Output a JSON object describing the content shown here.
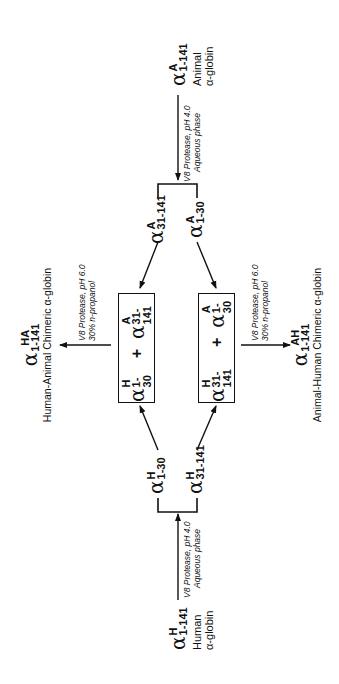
{
  "diagram": {
    "orientation": "rotated-90-ccw",
    "human_source": {
      "symbol": "α",
      "sup": "H",
      "sub": "1-141",
      "label_line1": "Human",
      "label_line2": "α-globin"
    },
    "animal_source": {
      "symbol": "α",
      "sup": "A",
      "sub": "1-141",
      "label_line1": "Animal",
      "label_line2": "α-globin"
    },
    "human_cleavage": {
      "line1": "V8 Protease, pH 4.0",
      "line2": "Aqueous phase"
    },
    "animal_cleavage": {
      "line1": "V8 Protease, pH 4.0",
      "line2": "Aqueous phase"
    },
    "human_fragments": [
      {
        "symbol": "α",
        "sup": "H",
        "sub": "1-30"
      },
      {
        "symbol": "α",
        "sup": "H",
        "sub": "31-141"
      }
    ],
    "animal_fragments": [
      {
        "symbol": "α",
        "sup": "A",
        "sub": "31-141"
      },
      {
        "symbol": "α",
        "sup": "A",
        "sub": "1-30"
      }
    ],
    "box_top": {
      "left": {
        "symbol": "α",
        "sup": "H",
        "sub": "1-30"
      },
      "op": "+",
      "right": {
        "symbol": "α",
        "sup": "A",
        "sub": "31-141"
      }
    },
    "box_bottom": {
      "left": {
        "symbol": "α",
        "sup": "H",
        "sub": "31-141"
      },
      "op": "+",
      "right": {
        "symbol": "α",
        "sup": "A",
        "sub": "1-30"
      }
    },
    "ligation_top": {
      "line1": "V8 Protease, pH 6.0",
      "line2": "30% n-propanol"
    },
    "ligation_bottom": {
      "line1": "V8 Protease, pH 6.0",
      "line2": "30% n-propanol"
    },
    "product_top": {
      "symbol": "α",
      "sup": "HA",
      "sub": "1-141",
      "label": "Human-Animal Chimeric  α-globin"
    },
    "product_bottom": {
      "symbol": "α",
      "sup": "AH",
      "sub": "1-141",
      "label": "Animal-Human Chimeric  α-globin"
    }
  }
}
